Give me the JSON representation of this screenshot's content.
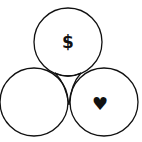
{
  "diagram": {
    "type": "three-circle-venn",
    "circles": [
      {
        "id": "top",
        "label": "$",
        "icon": "dollar-icon"
      },
      {
        "id": "bottom-left",
        "label": "",
        "icon": ""
      },
      {
        "id": "bottom-right",
        "label": "♥",
        "icon": "heart-icon"
      }
    ],
    "stroke_color": "#111111",
    "background": "#ffffff"
  }
}
